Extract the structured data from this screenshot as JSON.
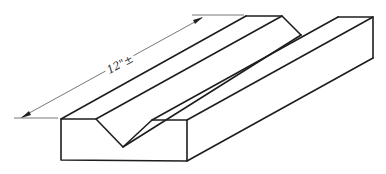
{
  "figure": {
    "dimension_label": "12\"±",
    "line_color": "#1e1e1e",
    "background": "#ffffff"
  },
  "geometry": {
    "front_face": {
      "top_left": [
        61,
        119
      ],
      "v_left": [
        96,
        119
      ],
      "v_bottom": [
        123,
        147
      ],
      "v_right": [
        152,
        120
      ],
      "top_right": [
        187,
        120
      ],
      "bottom_right": [
        187,
        161
      ],
      "bottom_left": [
        61,
        160
      ]
    },
    "back_face": {
      "top_left": [
        246,
        16
      ],
      "v_left": [
        282,
        16
      ],
      "v_bottom": [
        301,
        35
      ],
      "v_right": [
        338,
        17
      ],
      "top_right": [
        373,
        17
      ],
      "bottom_right": [
        373,
        58
      ]
    },
    "dimension_line": {
      "start": [
        22,
        117
      ],
      "end": [
        202,
        18
      ]
    }
  }
}
